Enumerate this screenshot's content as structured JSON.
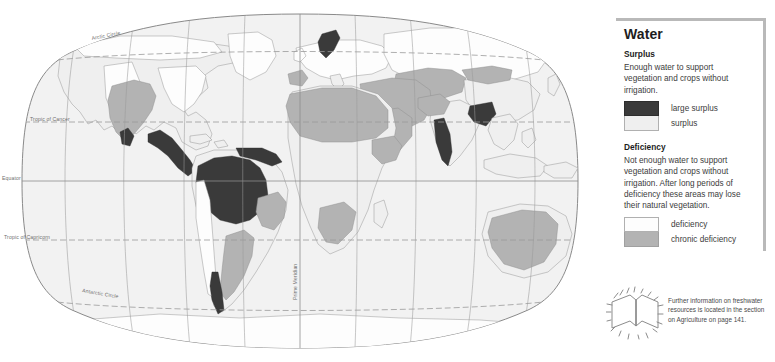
{
  "map": {
    "graticule_labels": [
      {
        "id": "arctic-circle",
        "text": "Arctic Circle"
      },
      {
        "id": "tropic-of-cancer",
        "text": "Tropic of Cancer"
      },
      {
        "id": "equator",
        "text": "Equator"
      },
      {
        "id": "tropic-of-capricorn",
        "text": "Tropic of Capricorn"
      },
      {
        "id": "antarctic-circle",
        "text": "Antarctic Circle"
      },
      {
        "id": "prime-meridian",
        "text": "Prime Meridian"
      }
    ]
  },
  "legend": {
    "title": "Water",
    "surplus": {
      "heading": "Surplus",
      "description": "Enough water to support vegetation and crops without irrigation.",
      "items": [
        {
          "label": "large surplus",
          "color": "#3a3a3a"
        },
        {
          "label": "surplus",
          "color": "#efefef"
        }
      ]
    },
    "deficiency": {
      "heading": "Deficiency",
      "description": "Not enough water to support vegetation and crops without irrigation. After long periods of deficiency these areas may lose their natural vegetation.",
      "items": [
        {
          "label": "deficiency",
          "color": "#fdfdfd"
        },
        {
          "label": "chronic deficiency",
          "color": "#b3b3b3"
        }
      ]
    }
  },
  "footnote": {
    "icon": "open-book-icon",
    "text": "Further information on freshwater resources is located in the section on Agriculture on page 141."
  }
}
